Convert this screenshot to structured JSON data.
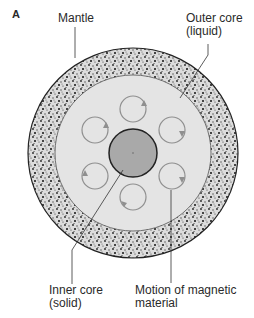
{
  "panel_label": "A",
  "labels": {
    "mantle": "Mantle",
    "outer_core_line1": "Outer core",
    "outer_core_line2": "(liquid)",
    "inner_core_line1": "Inner core",
    "inner_core_line2": "(solid)",
    "motion_line1": "Motion of magnetic",
    "motion_line2": "material"
  },
  "colors": {
    "mantle_fill": "#d9d9d9",
    "outer_core_fill": "#e4e4e4",
    "inner_core_fill": "#a9a9a9",
    "circulation_stroke": "#8f8f8f",
    "outline": "#333333"
  },
  "circulation_cells": 6
}
